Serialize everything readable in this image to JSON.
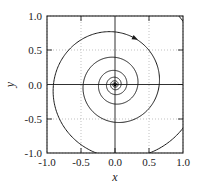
{
  "chart_data": {
    "type": "line",
    "title": "",
    "subtitle": "",
    "xlabel": "x",
    "ylabel": "y",
    "xlim": [
      -1.0,
      1.0
    ],
    "ylim": [
      -1.0,
      1.0
    ],
    "grid": true,
    "legend": null,
    "legend_position": "none",
    "xticks": [
      -1.0,
      -0.5,
      0.0,
      0.5,
      1.0
    ],
    "yticks": [
      -1.0,
      -0.5,
      0.0,
      0.5,
      1.0
    ],
    "xticklabels": [
      "-1.0",
      "-0.5",
      "0.0",
      "0.5",
      "1.0"
    ],
    "yticklabels": [
      "-1.0",
      "-0.5",
      "0.0",
      "0.5",
      "1.0"
    ],
    "annotations": [
      {
        "name": "direction-arrow",
        "x": 0.32,
        "y": 0.72,
        "symbol": "arrowhead",
        "label": ""
      }
    ],
    "series": [
      {
        "name": "spiral",
        "color": "#1a1a1a",
        "linewidth": 1.0,
        "spiral": {
          "form": "r = r0 * exp(-k * theta)",
          "r0": 1.42,
          "decay_k": 0.105,
          "theta_start": 0.0,
          "theta_end": 62.8,
          "phase": 1.15,
          "direction": "clockwise",
          "center": [
            0.0,
            0.0
          ]
        },
        "radii_at_positive_x_axis": [
          1.32,
          0.95,
          0.685,
          0.495,
          0.356,
          0.257,
          0.185,
          0.133,
          0.096,
          0.069,
          0.05,
          0.036,
          0.026,
          0.019,
          0.013,
          0.01,
          0.007
        ]
      }
    ]
  },
  "axes": {
    "x_axis_label": "x",
    "y_axis_label": "y",
    "zero_line_x": 0.0,
    "zero_line_y": 0.0
  },
  "colors": {
    "curve": "#1a1a1a",
    "axis": "#1a1a1a",
    "frame": "#1a1a1a",
    "grid": "#a8a8a8",
    "background": "#ffffff",
    "text": "#1a1a1a"
  }
}
